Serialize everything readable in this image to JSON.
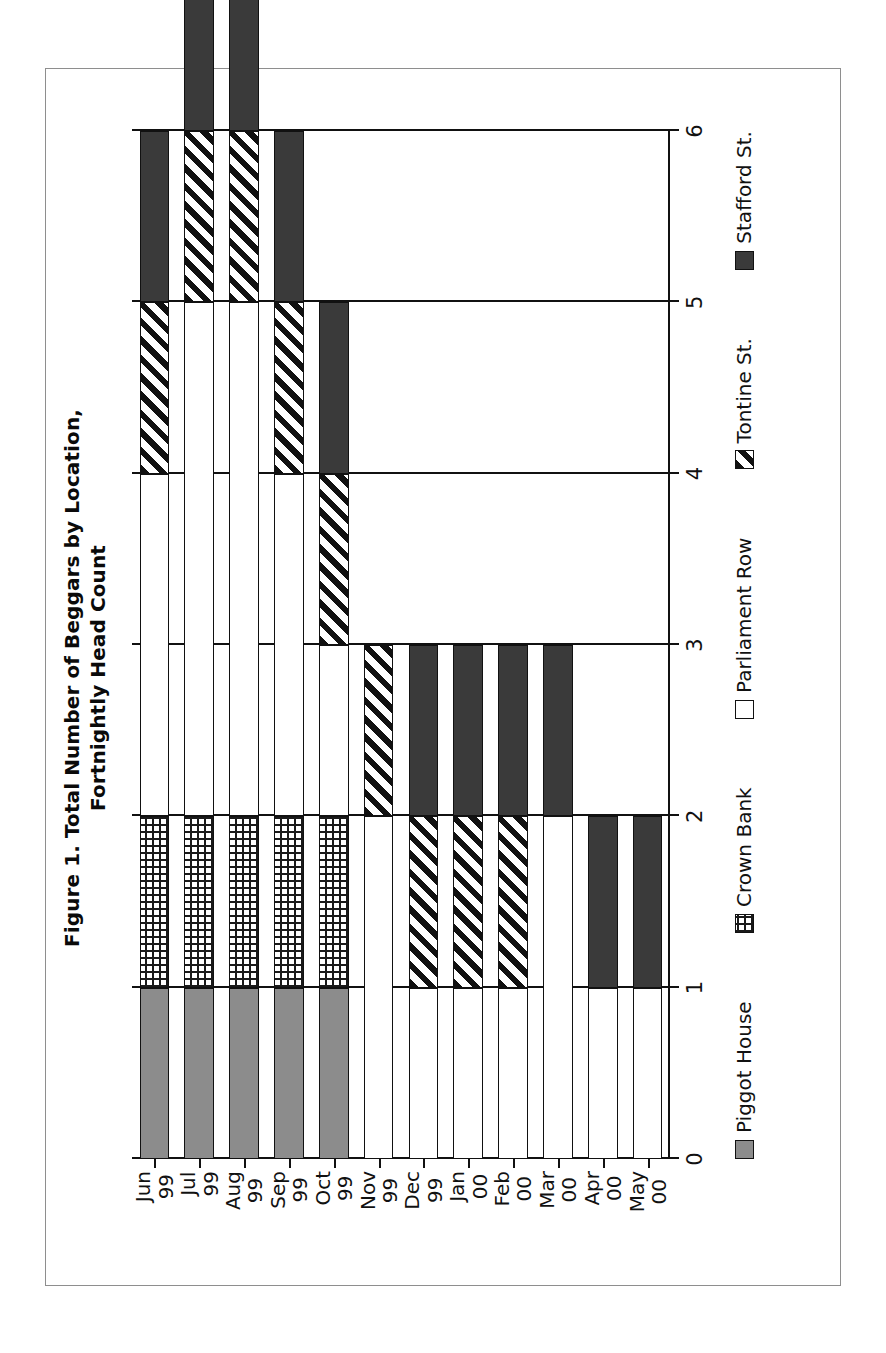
{
  "figure": {
    "title_line1": "Figure 1. Total Number of Beggars by Location,",
    "title_line2": "Fortnightly Head Count"
  },
  "colors": {
    "piggot_house": "#8c8c8c",
    "crown_bank": "#ffffff",
    "parliament_row": "#ffffff",
    "tontine_st": "#ffffff",
    "stafford_st": "#3a3a3a",
    "axis": "#111111",
    "frame": "#8e8e8e"
  },
  "legend": {
    "position": "bottom",
    "items": [
      {
        "label": "Piggot House",
        "pattern": "solid-gray"
      },
      {
        "label": "Crown Bank",
        "pattern": "grid"
      },
      {
        "label": "Parliament Row",
        "pattern": "empty"
      },
      {
        "label": "Tontine St.",
        "pattern": "diagonal-hatch"
      },
      {
        "label": "Stafford St.",
        "pattern": "solid-dark"
      }
    ]
  },
  "chart_data": {
    "type": "bar",
    "orientation": "horizontal-rotated",
    "stacked": true,
    "title": "Figure 1. Total Number of Beggars by Location, Fortnightly Head Count",
    "xlabel": "",
    "ylabel": "",
    "ylim": [
      0,
      6
    ],
    "yticks": [
      0,
      1,
      2,
      3,
      4,
      5,
      6
    ],
    "ytick_labels": [
      "0",
      "1",
      "2",
      "3",
      "4",
      "5",
      "6"
    ],
    "grid": true,
    "categories": [
      "Jun 99",
      "Jul 99",
      "Aug 99",
      "Sep 99",
      "Oct 99",
      "Nov 99",
      "Dec 99",
      "Jan 00",
      "Feb 00",
      "Mar 00",
      "Apr 00",
      "May 00"
    ],
    "category_lines": [
      [
        "Jun",
        "99"
      ],
      [
        "Jul",
        "99"
      ],
      [
        "Aug",
        "99"
      ],
      [
        "Sep",
        "99"
      ],
      [
        "Oct",
        "99"
      ],
      [
        "Nov",
        "99"
      ],
      [
        "Dec",
        "99"
      ],
      [
        "Jan",
        "00"
      ],
      [
        "Feb",
        "00"
      ],
      [
        "Mar",
        "00"
      ],
      [
        "Apr",
        "00"
      ],
      [
        "May",
        "00"
      ]
    ],
    "series": [
      {
        "name": "Piggot House",
        "values": [
          1,
          1,
          1,
          1,
          1,
          0,
          0,
          0,
          0,
          0,
          0,
          0
        ]
      },
      {
        "name": "Crown Bank",
        "values": [
          1,
          1,
          1,
          1,
          1,
          0,
          0,
          0,
          0,
          0,
          0,
          0
        ]
      },
      {
        "name": "Parliament Row",
        "values": [
          2,
          3,
          3,
          2,
          1,
          2,
          1,
          1,
          1,
          2,
          1,
          1
        ]
      },
      {
        "name": "Tontine St.",
        "values": [
          1,
          1,
          1,
          1,
          1,
          1,
          1,
          1,
          1,
          0,
          0,
          0
        ]
      },
      {
        "name": "Stafford St.",
        "values": [
          1,
          1,
          1,
          1,
          1,
          0,
          1,
          1,
          1,
          1,
          1,
          1
        ]
      }
    ],
    "totals": [
      6,
      7,
      7,
      6,
      5,
      3,
      3,
      3,
      3,
      3,
      2,
      2
    ]
  }
}
